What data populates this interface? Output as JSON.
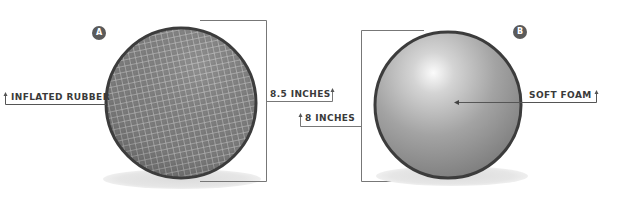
{
  "diagram": {
    "ball_a": {
      "badge": "A",
      "material_label": "INFLATED RUBBER",
      "diameter_label": "8.5 INCHES",
      "surface": "grid-textured"
    },
    "ball_b": {
      "badge": "B",
      "material_label": "SOFT FOAM",
      "diameter_label": "8 INCHES",
      "surface": "smooth-shaded"
    },
    "colors": {
      "outline": "#3c3c3c",
      "ball_a_fill": "#7a7a7a",
      "ball_b_light": "#f4f4f4",
      "ball_b_dark": "#7c7c7c",
      "shadow": "#e2e2e2",
      "leader_line": "#555555",
      "badge": "#5a5a5a",
      "text": "#3a3a3a"
    }
  }
}
